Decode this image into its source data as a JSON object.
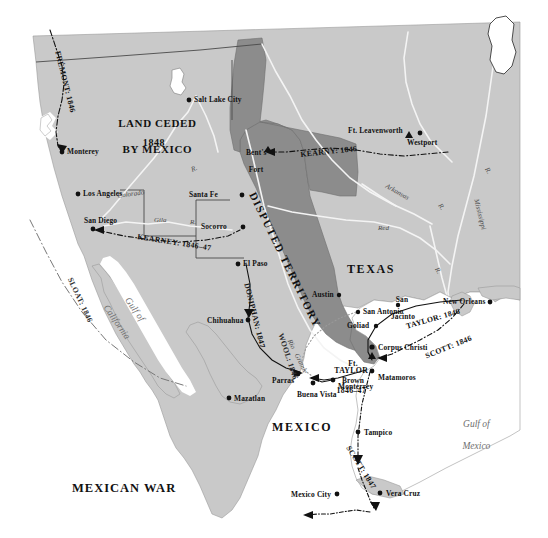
{
  "map": {
    "title": "MEXICAN WAR",
    "colors": {
      "ocean": "#ffffff",
      "land": "#c9c9c9",
      "disputed": "#8c8c8c",
      "ceded_boundary": "#5a5a5a",
      "ink": "#111111",
      "river": "#f2f2f2"
    },
    "regions": [
      {
        "name": "land-ceded-by-mexico",
        "line1": "LAND CEDED",
        "line2": "BY MEXICO",
        "year": "1848"
      },
      {
        "name": "disputed-territory",
        "label": "DISPUTED TERRITORY"
      },
      {
        "name": "texas",
        "label": "TEXAS"
      },
      {
        "name": "mexico",
        "label": "MEXICO"
      }
    ],
    "waters": [
      {
        "name": "gulf-of-california",
        "line1": "Gulf of",
        "line2": "California"
      },
      {
        "name": "gulf-of-mexico",
        "line1": "Gulf of",
        "line2": "Mexico"
      }
    ],
    "rivers": [
      {
        "name": "colorado-river",
        "label": "Colorado"
      },
      {
        "name": "colorado-river-abbrev",
        "label": "R."
      },
      {
        "name": "gila-river",
        "label": "Gila"
      },
      {
        "name": "gila-river-abbrev",
        "label": "R."
      },
      {
        "name": "rio-grande",
        "label": "Rio"
      },
      {
        "name": "rio-grande-second",
        "label": "Grande"
      },
      {
        "name": "arkansas-river",
        "label": "Arkansas"
      },
      {
        "name": "arkansas-river-abbrev",
        "label": "R."
      },
      {
        "name": "red-river",
        "label": "Red"
      },
      {
        "name": "red-river-abbrev",
        "label": "R."
      },
      {
        "name": "mississippi-river",
        "label": "Mississippi"
      },
      {
        "name": "mississippi-river-abbrev",
        "label": "R."
      }
    ],
    "cities": [
      {
        "name": "monterey-ca",
        "label": "Monterey",
        "marker": "dot"
      },
      {
        "name": "salt-lake-city",
        "label": "Salt Lake City",
        "marker": "dot"
      },
      {
        "name": "los-angeles",
        "label": "Los Angeles",
        "marker": "dot"
      },
      {
        "name": "san-diego",
        "label": "San Diego",
        "marker": "dot"
      },
      {
        "name": "santa-fe",
        "label": "Santa Fe",
        "marker": "dot"
      },
      {
        "name": "socorro",
        "label": "Socorro",
        "marker": "dot"
      },
      {
        "name": "el-paso",
        "label": "El Paso",
        "marker": "dot"
      },
      {
        "name": "bents-fort",
        "label": "Bent's",
        "label2": "Fort",
        "marker": "fort"
      },
      {
        "name": "ft-leavenworth",
        "label": "Ft. Leavenworth",
        "marker": "fort"
      },
      {
        "name": "westport",
        "label": "Westport",
        "marker": "dot"
      },
      {
        "name": "austin",
        "label": "Austin",
        "marker": "dot"
      },
      {
        "name": "san-antonio",
        "label": "San Antonio",
        "marker": "dot"
      },
      {
        "name": "goliad",
        "label": "Goliad",
        "marker": "dot"
      },
      {
        "name": "san-jacinto",
        "label": "San",
        "label2": "Jacinto",
        "marker": "dot"
      },
      {
        "name": "new-orleans",
        "label": "New Orleans",
        "marker": "dot"
      },
      {
        "name": "corpus-christi",
        "label": "Corpus Christi",
        "marker": "dot"
      },
      {
        "name": "ft-brown",
        "label": "Ft.",
        "label2": "Brown",
        "marker": "fort"
      },
      {
        "name": "matamoros",
        "label": "Matamoros",
        "marker": "dot"
      },
      {
        "name": "monterrey-mx",
        "label": "Monterrey",
        "marker": "dot"
      },
      {
        "name": "buena-vista",
        "label": "Buena Vista",
        "marker": "dot"
      },
      {
        "name": "parras",
        "label": "Parras",
        "marker": "dot"
      },
      {
        "name": "chihuahua",
        "label": "Chihuahua",
        "marker": "dot"
      },
      {
        "name": "mazatlan",
        "label": "Mazatlan",
        "marker": "dot"
      },
      {
        "name": "tampico",
        "label": "Tampico",
        "marker": "dot"
      },
      {
        "name": "vera-cruz",
        "label": "Vera Cruz",
        "marker": "dot"
      },
      {
        "name": "mexico-city",
        "label": "Mexico City",
        "marker": "dot"
      }
    ],
    "routes": [
      {
        "name": "route-fremont",
        "label": "FRÉMONT: 1846"
      },
      {
        "name": "route-sloat",
        "label": "SLOAT: 1846"
      },
      {
        "name": "route-kearney-southwest",
        "label": "KEARNEY: 1846–47"
      },
      {
        "name": "route-kearny-plains",
        "label": "KEARNY: 1846"
      },
      {
        "name": "route-doniphan",
        "label": "DONIPHAN: 1847"
      },
      {
        "name": "route-wool",
        "label": "WOOL: 1846"
      },
      {
        "name": "route-taylor-inland",
        "line1": "TAYLOR",
        "line2": "1846–47"
      },
      {
        "name": "route-taylor-gulf",
        "label": "TAYLOR: 1846"
      },
      {
        "name": "route-scott-1846",
        "label": "SCOTT: 1846"
      },
      {
        "name": "route-scott-1847",
        "label": "SCOTT: 1847"
      }
    ]
  }
}
